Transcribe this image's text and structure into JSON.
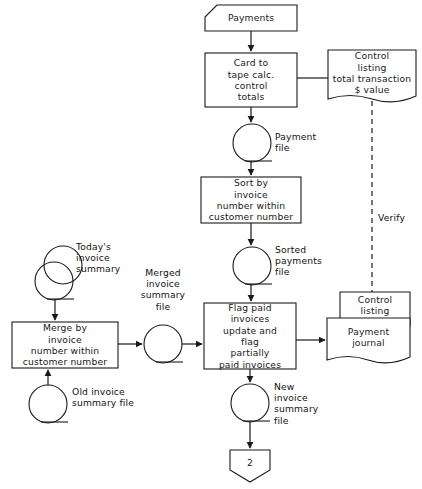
{
  "diagram": {
    "caption": "",
    "background_color": "#ffffff",
    "line_color": "#1a1a1a",
    "text_color": "#111111"
  },
  "nodes": {
    "payments_input": {
      "label": "Payments",
      "symbol": "input-data-clipped-corner",
      "x": 205,
      "y": 5,
      "w": 92,
      "h": 26
    },
    "card_to_tape": {
      "label": "Card to\ntape calc.\ncontrol\ntotals",
      "symbol": "process-box",
      "x": 205,
      "y": 53,
      "w": 92,
      "h": 54
    },
    "control_listing_totals": {
      "label": "Control\nlisting\ntotal transaction\n$ value",
      "symbol": "document",
      "x": 328,
      "y": 50,
      "w": 88,
      "h": 52
    },
    "payment_file": {
      "label": "Payment\nfile",
      "symbol": "magnetic-tape",
      "cx": 252,
      "cy": 143,
      "r": 19
    },
    "sort_by_invoice": {
      "label": "Sort by\ninvoice\nnumber within\ncustomer number",
      "symbol": "process-box",
      "x": 201,
      "y": 177,
      "w": 100,
      "h": 46
    },
    "sorted_payments_file": {
      "label": "Sorted\npayments\nfile",
      "symbol": "magnetic-tape",
      "cx": 252,
      "cy": 266,
      "r": 19
    },
    "todays_invoice_summary": {
      "label": "Today's\ninvoice\nsummary",
      "symbol": "magnetic-tape-stacked",
      "cx": 58,
      "cy": 274,
      "r": 19
    },
    "merge_by_invoice": {
      "label": "Merge by\ninvoice\nnumber within\ncustomer number",
      "symbol": "process-box",
      "x": 12,
      "y": 322,
      "w": 106,
      "h": 46
    },
    "old_invoice_summary_file": {
      "label": "Old invoice\nsummary file",
      "symbol": "magnetic-tape",
      "cx": 48,
      "cy": 404,
      "r": 19
    },
    "merged_invoice_summary_file": {
      "label": "Merged\ninvoice\nsummary\nfile",
      "symbol": "magnetic-tape",
      "cx": 163,
      "cy": 344,
      "r": 19
    },
    "flag_paid_invoices": {
      "label": "Flag paid\ninvoices\nupdate and\nflag\npartially\npaid invoices",
      "symbol": "process-box",
      "x": 204,
      "y": 303,
      "w": 92,
      "h": 66
    },
    "control_listing": {
      "label": "Control\nlisting",
      "symbol": "document",
      "x": 340,
      "y": 292,
      "w": 70,
      "h": 40
    },
    "payment_journal": {
      "label": "Payment\njournal",
      "symbol": "document",
      "x": 327,
      "y": 318,
      "w": 83,
      "h": 45
    },
    "new_invoice_summary_file": {
      "label": "New\ninvoice\nsummary\nfile",
      "symbol": "magnetic-tape",
      "cx": 250,
      "cy": 403,
      "r": 19
    },
    "offpage_connector": {
      "label": "2",
      "symbol": "offpage-connector",
      "x": 228,
      "y": 450,
      "w": 44,
      "h": 32
    }
  },
  "connector_labels": {
    "verify": "Verify"
  },
  "flows": [
    {
      "from": "payments_input",
      "to": "card_to_tape",
      "style": "solid-arrow"
    },
    {
      "from": "card_to_tape",
      "to": "control_listing_totals",
      "style": "solid-line"
    },
    {
      "from": "card_to_tape",
      "to": "payment_file",
      "style": "solid-arrow"
    },
    {
      "from": "payment_file",
      "to": "sort_by_invoice",
      "style": "solid-arrow"
    },
    {
      "from": "sort_by_invoice",
      "to": "sorted_payments_file",
      "style": "solid-arrow"
    },
    {
      "from": "sorted_payments_file",
      "to": "flag_paid_invoices",
      "style": "solid-arrow"
    },
    {
      "from": "todays_invoice_summary",
      "to": "merge_by_invoice",
      "style": "solid-arrow"
    },
    {
      "from": "old_invoice_summary_file",
      "to": "merge_by_invoice",
      "style": "solid-arrow"
    },
    {
      "from": "merge_by_invoice",
      "to": "merged_invoice_summary_file",
      "style": "solid-arrow"
    },
    {
      "from": "merged_invoice_summary_file",
      "to": "flag_paid_invoices",
      "style": "solid-arrow"
    },
    {
      "from": "flag_paid_invoices",
      "to": "payment_journal",
      "style": "solid-arrow"
    },
    {
      "from": "flag_paid_invoices",
      "to": "new_invoice_summary_file",
      "style": "solid-arrow"
    },
    {
      "from": "new_invoice_summary_file",
      "to": "offpage_connector",
      "style": "solid-arrow"
    },
    {
      "from": "control_listing_totals",
      "to": "control_listing",
      "style": "dashed-line",
      "label": "Verify"
    }
  ]
}
